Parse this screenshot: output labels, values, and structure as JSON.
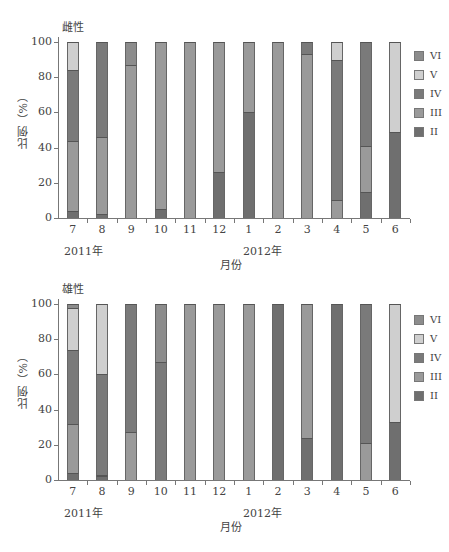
{
  "colors": {
    "II": "#6f6f6f",
    "III": "#9a9a9a",
    "IV": "#7a7a7a",
    "V": "#cfcfcf",
    "VI": "#8c8c8c"
  },
  "legend": [
    {
      "key": "VI",
      "label": "VI"
    },
    {
      "key": "V",
      "label": "V"
    },
    {
      "key": "IV",
      "label": "IV"
    },
    {
      "key": "III",
      "label": "III"
    },
    {
      "key": "II",
      "label": "II"
    }
  ],
  "x_axis_title": "月份",
  "y_axis_title": "比例（%）",
  "year_labels": {
    "y2011": "2011年",
    "y2012": "2012年"
  },
  "caption": "图 ... 2011—2012年 ...",
  "chart_data": [
    {
      "type": "bar",
      "stacked": true,
      "title": "雌性",
      "xlabel": "月份",
      "ylabel": "比例（%）",
      "ylim": [
        0,
        100
      ],
      "yticks": [
        0,
        20,
        40,
        60,
        80,
        100
      ],
      "categories": [
        "7",
        "8",
        "9",
        "10",
        "11",
        "12",
        "1",
        "2",
        "3",
        "4",
        "5",
        "6"
      ],
      "year_groups": [
        {
          "label": "2011年",
          "start": "7"
        },
        {
          "label": "2012年",
          "start": "1"
        }
      ],
      "legend_position": "right",
      "series": [
        {
          "name": "II",
          "values": [
            4,
            2,
            0,
            5,
            0,
            26,
            60,
            0,
            0,
            0,
            15,
            49
          ]
        },
        {
          "name": "III",
          "values": [
            40,
            44,
            87,
            95,
            100,
            74,
            40,
            100,
            93,
            10,
            26,
            0
          ]
        },
        {
          "name": "IV",
          "values": [
            40,
            54,
            0,
            0,
            0,
            0,
            0,
            0,
            7,
            80,
            59,
            0
          ]
        },
        {
          "name": "V",
          "values": [
            16,
            0,
            0,
            0,
            0,
            0,
            0,
            0,
            0,
            10,
            0,
            51
          ]
        },
        {
          "name": "VI",
          "values": [
            0,
            0,
            13,
            0,
            0,
            0,
            0,
            0,
            0,
            0,
            0,
            0
          ]
        }
      ]
    },
    {
      "type": "bar",
      "stacked": true,
      "title": "雄性",
      "xlabel": "月份",
      "ylabel": "比例（%）",
      "ylim": [
        0,
        100
      ],
      "yticks": [
        0,
        20,
        40,
        60,
        80,
        100
      ],
      "categories": [
        "7",
        "8",
        "9",
        "10",
        "11",
        "12",
        "1",
        "2",
        "3",
        "4",
        "5",
        "6"
      ],
      "year_groups": [
        {
          "label": "2011年",
          "start": "7"
        },
        {
          "label": "2012年",
          "start": "1"
        }
      ],
      "legend_position": "right",
      "series": [
        {
          "name": "II",
          "values": [
            4,
            2,
            0,
            0,
            0,
            0,
            0,
            100,
            24,
            100,
            0,
            33
          ]
        },
        {
          "name": "III",
          "values": [
            28,
            1,
            27,
            0,
            100,
            100,
            100,
            0,
            76,
            0,
            21,
            0
          ]
        },
        {
          "name": "IV",
          "values": [
            42,
            57,
            73,
            67,
            0,
            0,
            0,
            0,
            0,
            0,
            79,
            0
          ]
        },
        {
          "name": "V",
          "values": [
            24,
            40,
            0,
            0,
            0,
            0,
            0,
            0,
            0,
            0,
            0,
            67
          ]
        },
        {
          "name": "VI",
          "values": [
            2,
            0,
            0,
            33,
            0,
            0,
            0,
            0,
            0,
            0,
            0,
            0
          ]
        }
      ]
    }
  ]
}
